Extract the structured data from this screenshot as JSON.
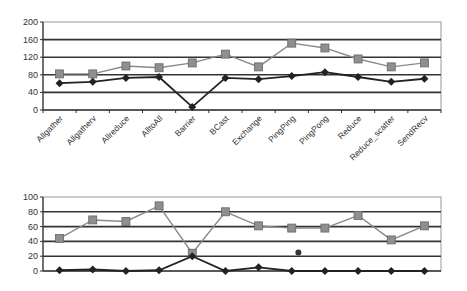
{
  "chart_data": [
    {
      "type": "line",
      "title": "",
      "xlabel": "",
      "ylabel": "",
      "ylim": [
        0,
        200
      ],
      "yticks": [
        0,
        40,
        80,
        120,
        160,
        200
      ],
      "grid": true,
      "legend": null,
      "categories": [
        "Allgather",
        "Allgatherv",
        "Allreduce",
        "AlltoAll",
        "Barrier",
        "BCast",
        "Exchange",
        "PingPing",
        "PingPong",
        "Reduce",
        "Reduce_scatter",
        "SendRecv"
      ],
      "series": [
        {
          "name": "squares",
          "marker": "square",
          "color": "#8a8a8a",
          "values": [
            82,
            82,
            100,
            96,
            107,
            127,
            98,
            152,
            141,
            116,
            98,
            107
          ]
        },
        {
          "name": "diamonds",
          "marker": "diamond",
          "color": "#222222",
          "values": [
            61,
            64,
            73,
            75,
            7,
            73,
            70,
            77,
            86,
            75,
            64,
            71
          ]
        }
      ]
    },
    {
      "type": "line",
      "title": "",
      "xlabel": "",
      "ylabel": "",
      "ylim": [
        0,
        100
      ],
      "yticks": [
        0,
        20,
        40,
        60,
        80,
        100
      ],
      "grid": true,
      "legend": null,
      "categories": [
        "Allgather",
        "Allgatherv",
        "Allreduce",
        "AlltoAll",
        "Barrier",
        "BCast",
        "Exchange",
        "PingPing",
        "PingPong",
        "Reduce",
        "Reduce_scatter",
        "SendRecv"
      ],
      "series": [
        {
          "name": "squares",
          "marker": "square",
          "color": "#8a8a8a",
          "values": [
            44,
            69,
            67,
            88,
            24,
            80,
            61,
            58,
            58,
            75,
            42,
            61
          ]
        },
        {
          "name": "diamonds",
          "marker": "diamond",
          "color": "#222222",
          "values": [
            1,
            2,
            0,
            1,
            20,
            0,
            5,
            0,
            0,
            0,
            0,
            0
          ]
        }
      ],
      "annotations": [
        {
          "type": "stray-point",
          "x_between": [
            "PingPing",
            "PingPong"
          ],
          "y": 25
        }
      ]
    }
  ]
}
